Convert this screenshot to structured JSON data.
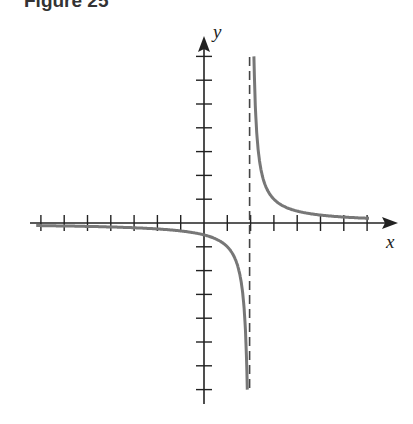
{
  "figure": {
    "title": "Figure 25"
  },
  "chart_data": {
    "type": "line",
    "title": "Figure 25",
    "xlabel": "x",
    "ylabel": "y",
    "function": "y = 1/(x - 2)",
    "vertical_asymptote": 2,
    "horizontal_asymptote": 0,
    "xlim": [
      -7,
      8
    ],
    "ylim": [
      -7,
      7
    ],
    "x_ticks": [
      -7,
      -6,
      -5,
      -4,
      -3,
      -2,
      -1,
      1,
      2,
      3,
      4,
      5,
      6,
      7
    ],
    "y_ticks": [
      -7,
      -6,
      -5,
      -4,
      -3,
      -2,
      -1,
      1,
      2,
      3,
      4,
      5,
      6,
      7
    ],
    "grid": false,
    "series": [
      {
        "name": "left branch",
        "x": [
          -7,
          -5,
          -3,
          -1,
          0,
          1,
          1.5,
          1.8,
          1.857
        ],
        "y": [
          -0.111,
          -0.143,
          -0.2,
          -0.333,
          -0.5,
          -1,
          -2,
          -5,
          -7
        ]
      },
      {
        "name": "right branch",
        "x": [
          2.143,
          2.2,
          2.5,
          3,
          4,
          5,
          6,
          7
        ],
        "y": [
          7,
          5,
          2,
          1,
          0.5,
          0.333,
          0.25,
          0.2
        ]
      }
    ],
    "colors": {
      "curve": "#777777",
      "axes": "#222222",
      "asymptote": "#444444"
    }
  }
}
